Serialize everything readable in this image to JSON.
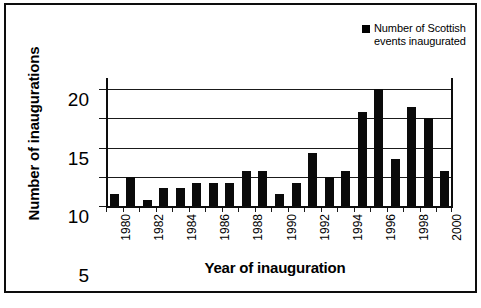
{
  "chart_data": {
    "type": "bar",
    "title": "",
    "xlabel": "Year  of inauguration",
    "ylabel": "Number of inaugurations",
    "legend": {
      "position": "top-right",
      "entries": [
        "Number of Scottish events inaugurated"
      ]
    },
    "series_name": "Number of Scottish events inaugurated",
    "categories": [
      "1980",
      "1981",
      "1982",
      "1983",
      "1984",
      "1985",
      "1986",
      "1987",
      "1988",
      "1989",
      "1990",
      "1991",
      "1992",
      "1993",
      "1994",
      "1995",
      "1996",
      "1997",
      "1998",
      "1999",
      "2000"
    ],
    "values": [
      2,
      5,
      1,
      3,
      3,
      4,
      4,
      4,
      6,
      6,
      2,
      4,
      9,
      5,
      6,
      16,
      20,
      8,
      17,
      15,
      6
    ],
    "xtick_labels": [
      "1980",
      "1982",
      "1984",
      "1986",
      "1988",
      "1990",
      "1992",
      "1994",
      "1996",
      "1998",
      "2000"
    ],
    "ytick_labels": [
      "0",
      "5",
      "10",
      "15",
      "20"
    ],
    "yticks": [
      0,
      5,
      10,
      15,
      20
    ],
    "ylim": [
      0,
      20
    ],
    "grid": true,
    "bar_color": "#0a0a0a",
    "frame_color": "#0d0d0d",
    "background": "#ffffff"
  }
}
